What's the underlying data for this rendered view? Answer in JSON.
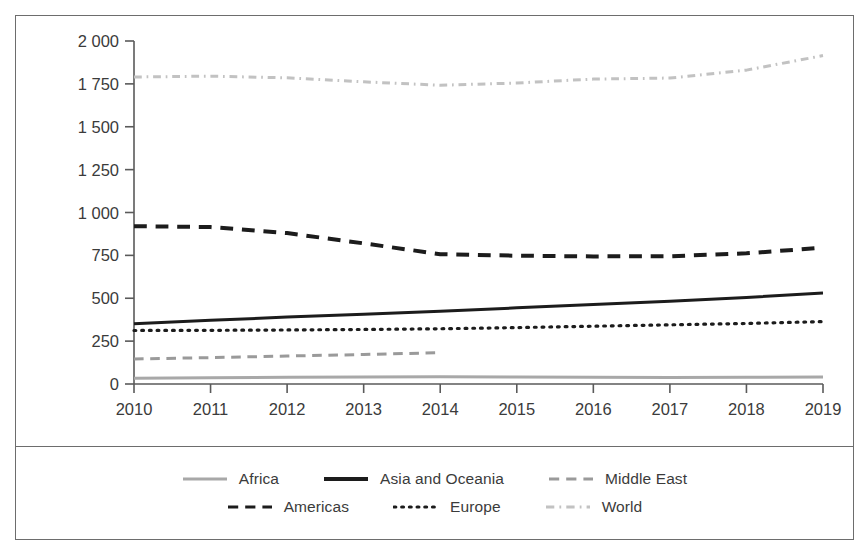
{
  "chart_data": {
    "type": "line",
    "title": "",
    "xlabel": "",
    "ylabel": "Constant (2018) US$ billion",
    "x": [
      2010,
      2011,
      2012,
      2013,
      2014,
      2015,
      2016,
      2017,
      2018,
      2019
    ],
    "xlim": [
      2010,
      2019
    ],
    "ylim": [
      0,
      2000
    ],
    "ytick_values": [
      0,
      250,
      500,
      750,
      1000,
      1250,
      1500,
      1750,
      2000
    ],
    "ytick_labels": [
      "0",
      "250",
      "500",
      "750",
      "1 000",
      "1 250",
      "1 500",
      "1 750",
      "2 000"
    ],
    "xtick_labels": [
      "2010",
      "2011",
      "2012",
      "2013",
      "2014",
      "2015",
      "2016",
      "2017",
      "2018",
      "2019"
    ],
    "grid": false,
    "legend_position": "bottom",
    "series": [
      {
        "name": "Africa",
        "style": "solid",
        "color": "#a8a8a8",
        "width": 3.0,
        "values": [
          33,
          36,
          39,
          41,
          42,
          41,
          39,
          38,
          39,
          41
        ]
      },
      {
        "name": "Asia and Oceania",
        "style": "solid",
        "color": "#1c1c1c",
        "width": 3.0,
        "values": [
          351,
          371,
          390,
          406,
          424,
          444,
          464,
          482,
          505,
          530
        ]
      },
      {
        "name": "Middle East",
        "style": "dashed",
        "color": "#9a9a9a",
        "width": 3.0,
        "values": [
          146,
          154,
          163,
          172,
          183,
          null,
          null,
          null,
          null,
          null
        ]
      },
      {
        "name": "Americas",
        "style": "dashed",
        "color": "#1c1c1c",
        "width": 4.0,
        "values": [
          920,
          915,
          880,
          820,
          757,
          748,
          744,
          745,
          762,
          795
        ]
      },
      {
        "name": "Europe",
        "style": "dotted",
        "color": "#1c1c1c",
        "width": 3.2,
        "values": [
          312,
          313,
          315,
          318,
          322,
          329,
          337,
          345,
          353,
          364
        ]
      },
      {
        "name": "World",
        "style": "dashdot",
        "color": "#c2c2c2",
        "width": 3.0,
        "values": [
          1790,
          1795,
          1785,
          1762,
          1742,
          1755,
          1778,
          1784,
          1830,
          1915
        ]
      }
    ]
  },
  "legend": {
    "rows": [
      [
        {
          "label": "Africa",
          "style": "solid",
          "color": "#a8a8a8"
        },
        {
          "label": "Asia and Oceania",
          "style": "solid",
          "color": "#1c1c1c"
        },
        {
          "label": "Middle East",
          "style": "dashed",
          "color": "#9a9a9a"
        }
      ],
      [
        {
          "label": "Americas",
          "style": "dashed",
          "color": "#1c1c1c"
        },
        {
          "label": "Europe",
          "style": "dotted",
          "color": "#1c1c1c"
        },
        {
          "label": "World",
          "style": "dashdot",
          "color": "#c2c2c2"
        }
      ]
    ]
  },
  "axis": {
    "color": "#5a5a5a"
  }
}
